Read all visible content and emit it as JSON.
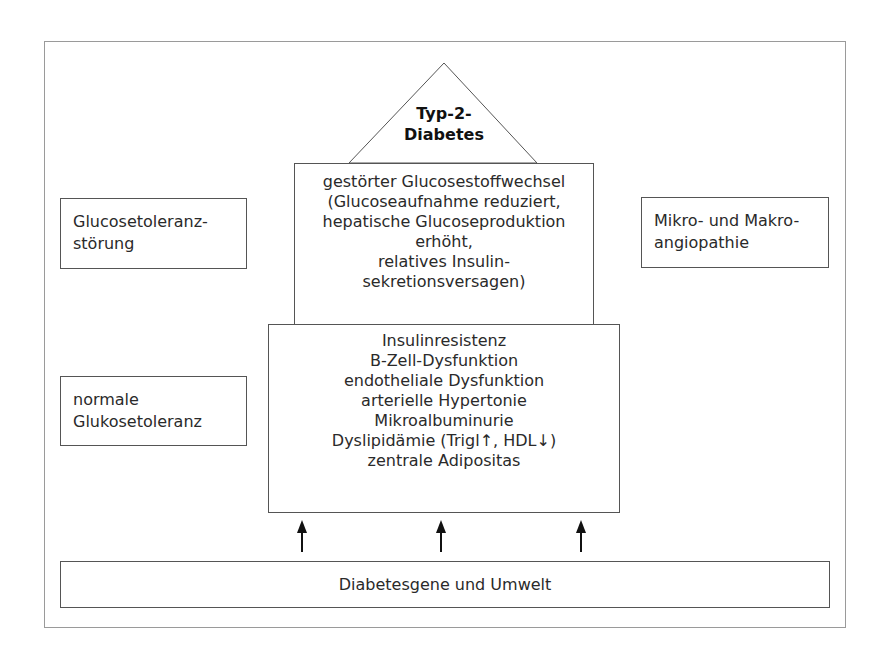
{
  "diagram": {
    "apex": {
      "lines": [
        "Typ-2-",
        "Diabetes"
      ]
    },
    "middle_box": {
      "lines": [
        "gestörter Glucosestoffwechsel",
        "(Glucoseaufnahme reduziert,",
        "hepatische Glucoseproduktion",
        "erhöht,",
        "relatives Insulin-",
        "sekretionsversagen)"
      ]
    },
    "lower_box": {
      "lines": [
        "Insulinresistenz",
        "B-Zell-Dysfunktion",
        "endotheliale Dysfunktion",
        "arterielle Hypertonie",
        "Mikroalbuminurie",
        "Dyslipidämie (Trigl↑, HDL↓)",
        "zentrale Adipositas"
      ]
    },
    "base_box": {
      "label": "Diabetesgene und Umwelt"
    },
    "left_upper": {
      "lines": [
        "Glucosetoleranz-",
        "störung"
      ]
    },
    "left_lower": {
      "lines": [
        "normale",
        "Glukosetoleranz"
      ]
    },
    "right_upper": {
      "lines": [
        "Mikro- und Makro-",
        "angiopathie"
      ]
    },
    "arrows": {
      "count": 3,
      "direction": "up"
    }
  }
}
